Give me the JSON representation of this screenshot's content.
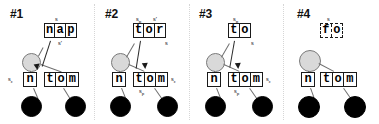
{
  "figure": {
    "kind": "parse-chart-derivation-sequence",
    "panel_count": 4
  },
  "panels": [
    {
      "id": "panel-1",
      "title": "#1",
      "upper_box": {
        "text": "nap",
        "cells": [
          "n",
          "a",
          "p"
        ],
        "border": "solid"
      },
      "upper_labels": {
        "top": "s",
        "top_sub": "",
        "top_right": "",
        "top_right_sub": "",
        "bottom_right": "s'",
        "bottom_right_sub": ""
      },
      "lower_left_box": {
        "text": "n",
        "cells": [
          "n"
        ],
        "border": "solid"
      },
      "lower_right_box": {
        "text": "tom",
        "cells": [
          "t",
          "o",
          "m"
        ],
        "border": "solid"
      },
      "lower_left_label": {
        "text": "s",
        "sub": "ε"
      },
      "lower_right_label": {
        "text": "",
        "sub": ""
      },
      "lower_below_label": {
        "text": "",
        "sub": ""
      },
      "has_arrow": true
    },
    {
      "id": "panel-2",
      "title": "#2",
      "upper_box": {
        "text": "tor",
        "cells": [
          "t",
          "o",
          "r"
        ],
        "border": "solid"
      },
      "upper_labels": {
        "top": "s",
        "top_sub": "p",
        "top_right": "s'",
        "top_right_sub": "",
        "bottom_right": "s",
        "bottom_right_sub": ""
      },
      "lower_left_box": {
        "text": "n",
        "cells": [
          "n"
        ],
        "border": "solid"
      },
      "lower_right_box": {
        "text": "tom",
        "cells": [
          "t",
          "o",
          "m"
        ],
        "border": "solid"
      },
      "lower_left_label": {
        "text": "",
        "sub": ""
      },
      "lower_right_label": {
        "text": "s",
        "sub": "ε"
      },
      "lower_below_label": {
        "text": "s",
        "sub": "p"
      },
      "has_arrow": true
    },
    {
      "id": "panel-3",
      "title": "#3",
      "upper_box": {
        "text": "to",
        "cells": [
          "t",
          "o"
        ],
        "border": "solid"
      },
      "upper_labels": {
        "top": "s",
        "top_sub": "p",
        "top_right": "",
        "top_right_sub": "",
        "bottom_right": "s",
        "bottom_right_sub": ""
      },
      "lower_left_box": {
        "text": "n",
        "cells": [
          "n"
        ],
        "border": "solid"
      },
      "lower_right_box": {
        "text": "tom",
        "cells": [
          "t",
          "o",
          "m"
        ],
        "border": "solid"
      },
      "lower_left_label": {
        "text": "",
        "sub": ""
      },
      "lower_right_label": {
        "text": "s",
        "sub": "ε"
      },
      "lower_below_label": {
        "text": "s",
        "sub": "p"
      },
      "has_arrow": true
    },
    {
      "id": "panel-4",
      "title": "#4",
      "upper_box": {
        "text": "fo",
        "cells": [
          "f",
          "o"
        ],
        "border": "dashed"
      },
      "upper_labels": {
        "top": "s",
        "top_sub": "",
        "top_right": "",
        "top_right_sub": "",
        "bottom_right": "",
        "bottom_right_sub": ""
      },
      "lower_left_box": {
        "text": "n",
        "cells": [
          "n"
        ],
        "border": "solid"
      },
      "lower_right_box": {
        "text": "tom",
        "cells": [
          "t",
          "o",
          "m"
        ],
        "border": "solid"
      },
      "lower_left_label": {
        "text": "",
        "sub": ""
      },
      "lower_right_label": {
        "text": "",
        "sub": ""
      },
      "lower_below_label": {
        "text": "",
        "sub": ""
      },
      "has_arrow": false
    }
  ],
  "colors": {
    "open_node_fill": "#d9d9d9",
    "open_node_stroke": "#7a7a7a",
    "filled_node_fill": "#000000",
    "box_stroke": "#1a1a1a",
    "edge_stroke": "#6f6f6f",
    "divider_stroke": "#d6d6d6",
    "text": "#000000",
    "background": "#ffffff"
  }
}
